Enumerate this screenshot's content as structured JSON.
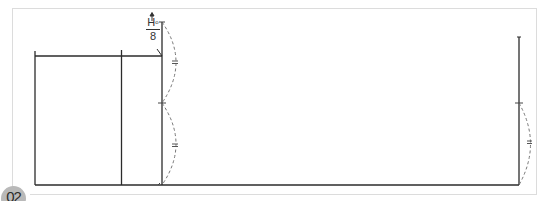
{
  "figure": {
    "step_badge": "02",
    "annotation": {
      "numerator": "H",
      "superscript": "o",
      "denominator": "8",
      "arrow": "up-arrow"
    },
    "equal_marks": [
      "=",
      "=",
      "="
    ],
    "colors": {
      "line": "#2b2b2b",
      "dashed": "#777777",
      "frame": "#dcdcdc",
      "badge_bg": "#b9b9b9",
      "badge_text": "#2a2a2a"
    }
  }
}
